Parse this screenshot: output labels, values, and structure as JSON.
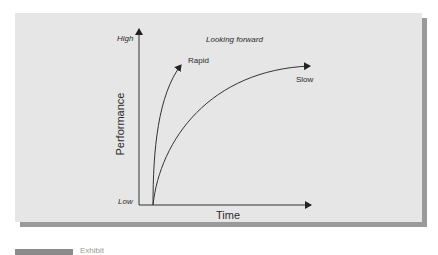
{
  "diagram": {
    "title": "Looking forward",
    "y_axis": {
      "label": "Performance",
      "high_label": "High",
      "low_label": "Low"
    },
    "x_axis": {
      "label": "Time"
    },
    "curves": [
      {
        "name": "Rapid",
        "description": "steep rise to high performance quickly"
      },
      {
        "name": "Slow",
        "description": "gradual rise leveling off over time"
      }
    ],
    "caption_text": "Exhibit"
  },
  "colors": {
    "panel_bg": "#e6e6e6",
    "panel_shadow": "#9a9a9a",
    "line": "#333333",
    "text": "#2a2a2a"
  }
}
